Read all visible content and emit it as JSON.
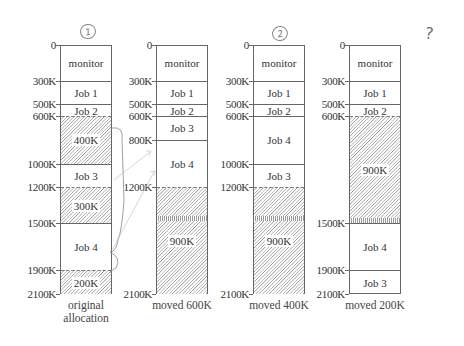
{
  "diagram": {
    "scale": {
      "max_k": 2100,
      "top_px": 45,
      "bottom_px": 294
    },
    "annotations": {
      "circle_1": "1",
      "circle_2": "2",
      "question": "?"
    },
    "columns": [
      {
        "id": "original",
        "caption_line1": "original",
        "caption_line2": "allocation",
        "left_px": 60,
        "ticks": [
          "0",
          "300K",
          "500K",
          "600K",
          "1000K",
          "1200K",
          "1500K",
          "1900K",
          "2100K"
        ],
        "tick_values": [
          0,
          300,
          500,
          600,
          1000,
          1200,
          1500,
          1900,
          2100
        ],
        "segments": [
          {
            "label": "monitor",
            "start": 0,
            "end": 300,
            "hole": false
          },
          {
            "label": "Job 1",
            "start": 300,
            "end": 500,
            "hole": false
          },
          {
            "label": "Job 2",
            "start": 500,
            "end": 600,
            "hole": false
          },
          {
            "label": "400K",
            "start": 600,
            "end": 1000,
            "hole": true
          },
          {
            "label": "Job 3",
            "start": 1000,
            "end": 1200,
            "hole": false
          },
          {
            "label": "300K",
            "start": 1200,
            "end": 1500,
            "hole": true
          },
          {
            "label": "Job 4",
            "start": 1500,
            "end": 1900,
            "hole": false
          },
          {
            "label": "200K",
            "start": 1900,
            "end": 2100,
            "hole": true
          }
        ]
      },
      {
        "id": "moved600",
        "caption_line1": "moved 600K",
        "caption_line2": "",
        "left_px": 156,
        "ticks": [
          "0",
          "300K",
          "500K",
          "600K",
          "800K",
          "1200K",
          "2100K"
        ],
        "tick_values": [
          0,
          300,
          500,
          600,
          800,
          1200,
          2100
        ],
        "segments": [
          {
            "label": "monitor",
            "start": 0,
            "end": 300,
            "hole": false
          },
          {
            "label": "Job 1",
            "start": 300,
            "end": 500,
            "hole": false
          },
          {
            "label": "Job 2",
            "start": 500,
            "end": 600,
            "hole": false
          },
          {
            "label": "Job 3",
            "start": 600,
            "end": 800,
            "hole": false
          },
          {
            "label": "Job 4",
            "start": 800,
            "end": 1200,
            "hole": false
          },
          {
            "label": "900K",
            "start": 1200,
            "end": 2100,
            "hole": true
          }
        ]
      },
      {
        "id": "moved400",
        "caption_line1": "moved 400K",
        "caption_line2": "",
        "left_px": 253,
        "ticks": [
          "0",
          "300K",
          "500K",
          "600K",
          "1000K",
          "1200K",
          "2100K"
        ],
        "tick_values": [
          0,
          300,
          500,
          600,
          1000,
          1200,
          2100
        ],
        "segments": [
          {
            "label": "monitor",
            "start": 0,
            "end": 300,
            "hole": false
          },
          {
            "label": "Job 1",
            "start": 300,
            "end": 500,
            "hole": false
          },
          {
            "label": "Job 2",
            "start": 500,
            "end": 600,
            "hole": false
          },
          {
            "label": "Job 4",
            "start": 600,
            "end": 1000,
            "hole": false
          },
          {
            "label": "Job 3",
            "start": 1000,
            "end": 1200,
            "hole": false
          },
          {
            "label": "900K",
            "start": 1200,
            "end": 2100,
            "hole": true
          }
        ]
      },
      {
        "id": "moved200",
        "caption_line1": "moved 200K",
        "caption_line2": "",
        "left_px": 349,
        "ticks": [
          "0",
          "300K",
          "500K",
          "600K",
          "1500K",
          "1900K",
          "2100K"
        ],
        "tick_values": [
          0,
          300,
          500,
          600,
          1500,
          1900,
          2100
        ],
        "segments": [
          {
            "label": "monitor",
            "start": 0,
            "end": 300,
            "hole": false
          },
          {
            "label": "Job 1",
            "start": 300,
            "end": 500,
            "hole": false
          },
          {
            "label": "Job 2",
            "start": 500,
            "end": 600,
            "hole": false
          },
          {
            "label": "900K",
            "start": 600,
            "end": 1500,
            "hole": true
          },
          {
            "label": "Job 4",
            "start": 1500,
            "end": 1900,
            "hole": false
          },
          {
            "label": "Job 3",
            "start": 1900,
            "end": 2100,
            "hole": false
          }
        ]
      }
    ]
  }
}
